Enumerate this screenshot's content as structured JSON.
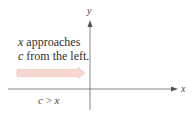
{
  "figure": {
    "axes": {
      "x_label": "x",
      "y_label": "y"
    },
    "caption": {
      "line1_var": "x",
      "line1_text": " approaches",
      "line2_var": "c",
      "line2_text": " from the left."
    },
    "condition": {
      "left": "c",
      "op": " > ",
      "right": "x"
    },
    "arrow": {
      "direction": "right",
      "fill_color": "#f6d3d0",
      "stroke_color": "#efb8b2"
    },
    "colors": {
      "axis": "#555555",
      "text": "#333333"
    }
  }
}
